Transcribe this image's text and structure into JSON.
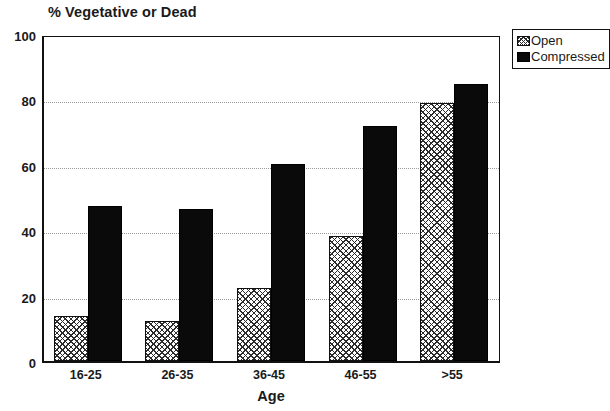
{
  "chart_data": {
    "type": "bar",
    "title": "% Vegetative or Dead",
    "xlabel": "Age",
    "ylabel": "",
    "categories": [
      "16-25",
      "26-35",
      "36-45",
      "46-55",
      ">55"
    ],
    "series": [
      {
        "name": "Open",
        "values": [
          13.8,
          12.2,
          22.2,
          38.2,
          79.0
        ],
        "pattern": "crosshatch",
        "color": "#ffffff"
      },
      {
        "name": "Compressed",
        "values": [
          47.4,
          46.5,
          60.4,
          71.8,
          84.6
        ],
        "pattern": "solid",
        "color": "#0a0a0a"
      }
    ],
    "ylim": [
      0,
      100
    ],
    "yticks": [
      0,
      20,
      40,
      60,
      80,
      100
    ],
    "ytick_labels": [
      "0",
      "20",
      "40",
      "60",
      "80",
      "100"
    ],
    "grid": true,
    "grid_style": "dotted-horizontal",
    "legend_position": "top-right-outside",
    "legend_entries": [
      "Open",
      "Compressed"
    ]
  },
  "legend": {
    "open_label": "Open",
    "compressed_label": "Compressed"
  }
}
